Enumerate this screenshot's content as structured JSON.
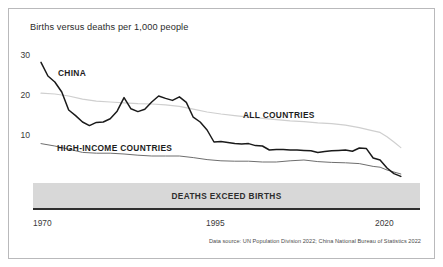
{
  "figure": {
    "title": "Births versus deaths per 1,000 people",
    "source": "Data source: UN Population Division 2022; China National Bureau of Statistics 2022",
    "band_label": "DEATHS EXCEED BIRTHS",
    "border_color": "#b9b9bb",
    "band_color": "#d8d8d8",
    "background": "#ffffff"
  },
  "axes": {
    "y_ticks": [
      "30",
      "20",
      "10"
    ],
    "y_tick_values": [
      30,
      20,
      10
    ],
    "x_ticks": [
      "1970",
      "1995",
      "2020"
    ],
    "x_tick_values": [
      1970,
      1995,
      2020
    ]
  },
  "labels": {
    "china": "CHINA",
    "high_income": "HIGH-INCOME COUNTRIES",
    "all_countries": "ALL COUNTRIES"
  },
  "chart_data": {
    "type": "line",
    "title": "Births versus deaths per 1,000 people",
    "subtitle": "",
    "xlabel": "",
    "ylabel": "Births minus deaths per 1,000 people",
    "xlim": [
      1970,
      2022
    ],
    "ylim": [
      -2,
      32
    ],
    "grid": false,
    "legend": "inline-annotations",
    "annotations": [
      {
        "text": "CHINA",
        "x": 1973.5,
        "y": 25.5
      },
      {
        "text": "HIGH-INCOME COUNTRIES",
        "x": 1973.5,
        "y": 7.3
      },
      {
        "text": "ALL COUNTRIES",
        "x": 2000.5,
        "y": 15.5
      },
      {
        "text": "DEATHS EXCEED BIRTHS",
        "x": 1996,
        "y": -2.8
      }
    ],
    "series": [
      {
        "name": "CHINA",
        "color": "#1a1a1a",
        "width": 1.5,
        "x": [
          1970,
          1971,
          1972,
          1973,
          1974,
          1975,
          1976,
          1977,
          1978,
          1979,
          1980,
          1981,
          1982,
          1983,
          1984,
          1985,
          1986,
          1987,
          1988,
          1989,
          1990,
          1991,
          1992,
          1993,
          1994,
          1995,
          1996,
          1997,
          1998,
          1999,
          2000,
          2001,
          2002,
          2003,
          2004,
          2005,
          2006,
          2007,
          2008,
          2009,
          2010,
          2011,
          2012,
          2013,
          2014,
          2015,
          2016,
          2017,
          2018,
          2019,
          2020,
          2021,
          2022
        ],
        "values": [
          27.9,
          24.5,
          23.0,
          20.5,
          16.0,
          14.6,
          13.0,
          12.1,
          12.9,
          13.0,
          13.8,
          15.7,
          19.1,
          16.3,
          15.6,
          16.2,
          18.0,
          19.5,
          18.9,
          18.4,
          19.3,
          17.9,
          14.2,
          13.0,
          11.0,
          8.0,
          8.1,
          7.9,
          7.6,
          7.5,
          7.6,
          7.1,
          7.0,
          6.0,
          6.1,
          6.1,
          6.0,
          6.0,
          5.9,
          5.8,
          5.4,
          5.6,
          5.8,
          5.9,
          6.0,
          5.7,
          6.5,
          6.4,
          4.0,
          3.5,
          1.5,
          0.1,
          -0.6
        ]
      },
      {
        "name": "HIGH-INCOME COUNTRIES",
        "color": "#6e6e6e",
        "width": 1.0,
        "x": [
          1970,
          1972,
          1974,
          1976,
          1978,
          1980,
          1982,
          1984,
          1986,
          1988,
          1990,
          1992,
          1994,
          1996,
          1998,
          2000,
          2002,
          2004,
          2006,
          2008,
          2010,
          2012,
          2014,
          2016,
          2018,
          2019,
          2020,
          2021,
          2022
        ],
        "values": [
          7.6,
          7.0,
          6.2,
          5.4,
          5.2,
          5.2,
          5.0,
          4.7,
          4.5,
          4.5,
          4.5,
          4.1,
          3.6,
          3.3,
          3.2,
          3.2,
          3.0,
          3.0,
          3.3,
          3.5,
          3.1,
          2.9,
          2.8,
          2.6,
          1.9,
          1.7,
          1.0,
          0.5,
          0.0
        ]
      },
      {
        "name": "ALL COUNTRIES",
        "color": "#cfcfcf",
        "width": 1.2,
        "x": [
          1970,
          1972,
          1974,
          1976,
          1978,
          1980,
          1982,
          1984,
          1986,
          1988,
          1990,
          1992,
          1994,
          1996,
          1998,
          2000,
          2002,
          2004,
          2006,
          2008,
          2010,
          2012,
          2014,
          2016,
          2018,
          2019,
          2020,
          2021,
          2022
        ],
        "values": [
          20.2,
          20.0,
          19.5,
          18.7,
          18.2,
          18.0,
          17.8,
          17.6,
          17.5,
          17.3,
          16.9,
          16.2,
          15.5,
          15.0,
          14.6,
          14.2,
          13.9,
          13.6,
          13.3,
          13.1,
          12.8,
          12.6,
          12.2,
          11.6,
          10.8,
          10.4,
          9.3,
          8.0,
          6.6
        ]
      }
    ]
  }
}
